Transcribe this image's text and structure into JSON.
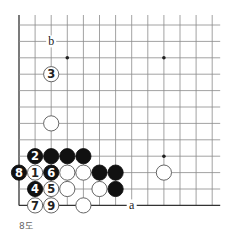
{
  "diagram": {
    "caption": "8도",
    "grid": {
      "origin_x": 19,
      "origin_y": 25,
      "spacing_x": 16.1,
      "spacing_y": 16.4,
      "cols": 13,
      "rows": 12,
      "left_edge": true,
      "bottom_edge": true,
      "top_overhang": 10,
      "right_overhang": 8,
      "line_color": "#8a8a8a",
      "edge_color": "#333333"
    },
    "star_points": [
      {
        "c": 3,
        "r": 2
      },
      {
        "c": 9,
        "r": 2
      },
      {
        "c": 9,
        "r": 8
      }
    ],
    "stones": [
      {
        "c": 2,
        "r": 3,
        "color": "white",
        "label": "3"
      },
      {
        "c": 2,
        "r": 6,
        "color": "white",
        "label": ""
      },
      {
        "c": 1,
        "r": 8,
        "color": "black",
        "label": "2"
      },
      {
        "c": 2,
        "r": 8,
        "color": "black",
        "label": ""
      },
      {
        "c": 3,
        "r": 8,
        "color": "black",
        "label": ""
      },
      {
        "c": 4,
        "r": 8,
        "color": "black",
        "label": ""
      },
      {
        "c": 0,
        "r": 9,
        "color": "black",
        "label": "8"
      },
      {
        "c": 1,
        "r": 9,
        "color": "white",
        "label": "1"
      },
      {
        "c": 2,
        "r": 9,
        "color": "black",
        "label": "6"
      },
      {
        "c": 3,
        "r": 9,
        "color": "white",
        "label": ""
      },
      {
        "c": 4,
        "r": 9,
        "color": "white",
        "label": ""
      },
      {
        "c": 5,
        "r": 9,
        "color": "black",
        "label": ""
      },
      {
        "c": 6,
        "r": 9,
        "color": "black",
        "label": ""
      },
      {
        "c": 9,
        "r": 9,
        "color": "white",
        "label": ""
      },
      {
        "c": 1,
        "r": 10,
        "color": "black",
        "label": "4"
      },
      {
        "c": 2,
        "r": 10,
        "color": "white",
        "label": "5"
      },
      {
        "c": 3,
        "r": 10,
        "color": "white",
        "label": ""
      },
      {
        "c": 5,
        "r": 10,
        "color": "white",
        "label": ""
      },
      {
        "c": 6,
        "r": 10,
        "color": "black",
        "label": ""
      },
      {
        "c": 1,
        "r": 11,
        "color": "white",
        "label": "7"
      },
      {
        "c": 2,
        "r": 11,
        "color": "white",
        "label": "9"
      },
      {
        "c": 4,
        "r": 11,
        "color": "white",
        "label": ""
      }
    ],
    "markers": [
      {
        "c": 2,
        "r": 1,
        "label": "b"
      },
      {
        "c": 7,
        "r": 11,
        "label": "a"
      }
    ]
  }
}
